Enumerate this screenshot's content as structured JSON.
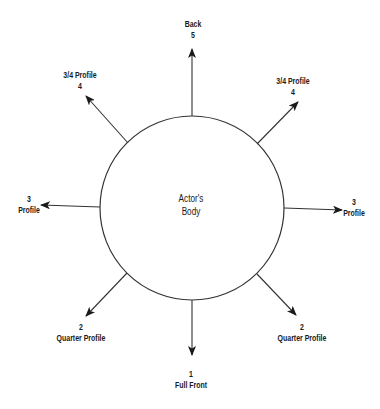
{
  "diagram": {
    "center": {
      "line1": "Actor's",
      "line2": "Body"
    },
    "directions": [
      {
        "id": "back",
        "number": "5",
        "name": "Back"
      },
      {
        "id": "three-quarter-left",
        "number": "4",
        "name": "3/4 Profile"
      },
      {
        "id": "three-quarter-right",
        "number": "4",
        "name": "3/4 Profile"
      },
      {
        "id": "profile-left",
        "number": "3",
        "name": "Profile"
      },
      {
        "id": "profile-right",
        "number": "3",
        "name": "Profile"
      },
      {
        "id": "quarter-left",
        "number": "2",
        "name": "Quarter Profile"
      },
      {
        "id": "quarter-right",
        "number": "2",
        "name": "Quarter Profile"
      },
      {
        "id": "full-front",
        "number": "1",
        "name": "Full Front"
      }
    ]
  }
}
